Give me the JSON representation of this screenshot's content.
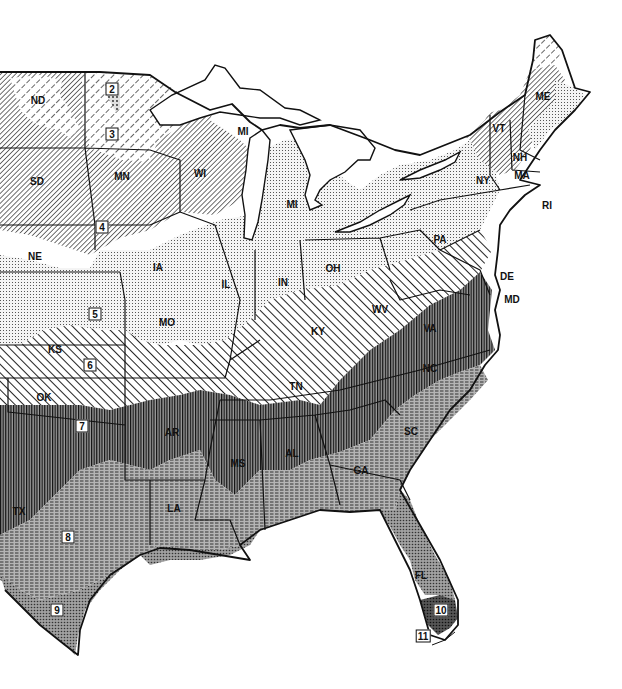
{
  "map": {
    "title": "",
    "colors": {
      "background": "#ffffff",
      "ink": "#111111",
      "zone_dark_fill": "#6e6e6e",
      "zone_mid_fill": "#a8a8a8",
      "zone_light_fill": "#e6e6e6"
    },
    "zones": [
      {
        "id": "2",
        "label": "2",
        "pattern": "fine-dots-dark",
        "x": 112,
        "y": 89
      },
      {
        "id": "3",
        "label": "3",
        "pattern": "wide-diagonal-dash",
        "x": 112,
        "y": 134
      },
      {
        "id": "4",
        "label": "4",
        "pattern": "dense-diagonal",
        "x": 102,
        "y": 227
      },
      {
        "id": "5",
        "label": "5",
        "pattern": "dot-grid-light",
        "x": 95,
        "y": 314
      },
      {
        "id": "6",
        "label": "6",
        "pattern": "wide-diagonal-solid",
        "x": 90,
        "y": 365
      },
      {
        "id": "7",
        "label": "7",
        "pattern": "vertical-lines-dark",
        "x": 82,
        "y": 426
      },
      {
        "id": "8",
        "label": "8",
        "pattern": "horizontal-dash-mid",
        "x": 68,
        "y": 537
      },
      {
        "id": "9",
        "label": "9",
        "pattern": "crosshatch-dots-mid",
        "x": 57,
        "y": 610
      },
      {
        "id": "10",
        "label": "10",
        "pattern": "dark-crosshatch",
        "x": 441,
        "y": 610
      },
      {
        "id": "11",
        "label": "11",
        "pattern": "white",
        "x": 423,
        "y": 636
      }
    ],
    "states": [
      {
        "abbr": "ND",
        "x": 38,
        "y": 100
      },
      {
        "abbr": "SD",
        "x": 37,
        "y": 181
      },
      {
        "abbr": "NE",
        "x": 35,
        "y": 256
      },
      {
        "abbr": "KS",
        "x": 55,
        "y": 349
      },
      {
        "abbr": "OK",
        "x": 44,
        "y": 397
      },
      {
        "abbr": "TX",
        "x": 19,
        "y": 511
      },
      {
        "abbr": "MN",
        "x": 122,
        "y": 176
      },
      {
        "abbr": "IA",
        "x": 158,
        "y": 267
      },
      {
        "abbr": "MO",
        "x": 167,
        "y": 322
      },
      {
        "abbr": "AR",
        "x": 172,
        "y": 432
      },
      {
        "abbr": "LA",
        "x": 174,
        "y": 508
      },
      {
        "abbr": "WI",
        "x": 200,
        "y": 173
      },
      {
        "abbr": "MI",
        "x": 243,
        "y": 131
      },
      {
        "abbr": "MI",
        "x": 292,
        "y": 204
      },
      {
        "abbr": "IL",
        "x": 226,
        "y": 284
      },
      {
        "abbr": "IN",
        "x": 283,
        "y": 282
      },
      {
        "abbr": "OH",
        "x": 333,
        "y": 268
      },
      {
        "abbr": "KY",
        "x": 318,
        "y": 331
      },
      {
        "abbr": "TN",
        "x": 296,
        "y": 386
      },
      {
        "abbr": "MS",
        "x": 238,
        "y": 463
      },
      {
        "abbr": "AL",
        "x": 292,
        "y": 453
      },
      {
        "abbr": "GA",
        "x": 361,
        "y": 470
      },
      {
        "abbr": "SC",
        "x": 411,
        "y": 431
      },
      {
        "abbr": "FL",
        "x": 421,
        "y": 575
      },
      {
        "abbr": "NC",
        "x": 430,
        "y": 368
      },
      {
        "abbr": "VA",
        "x": 430,
        "y": 328
      },
      {
        "abbr": "WV",
        "x": 380,
        "y": 309
      },
      {
        "abbr": "PA",
        "x": 440,
        "y": 239
      },
      {
        "abbr": "NY",
        "x": 483,
        "y": 180
      },
      {
        "abbr": "VT",
        "x": 499,
        "y": 128
      },
      {
        "abbr": "NH",
        "x": 520,
        "y": 157
      },
      {
        "abbr": "MA",
        "x": 522,
        "y": 175
      },
      {
        "abbr": "ME",
        "x": 543,
        "y": 96
      },
      {
        "abbr": "RI",
        "x": 547,
        "y": 205
      },
      {
        "abbr": "DE",
        "x": 507,
        "y": 276
      },
      {
        "abbr": "MD",
        "x": 512,
        "y": 299
      }
    ]
  }
}
